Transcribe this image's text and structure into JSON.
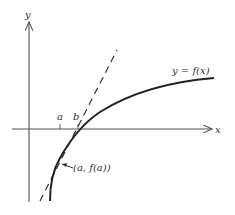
{
  "diagram": {
    "axes": {
      "x_label": "x",
      "y_label": "y"
    },
    "curve_label": "y = f(x)",
    "point_label": "(a, f(a))",
    "ticks": {
      "a_label": "a",
      "b_label": "b"
    },
    "colors": {
      "stroke": "#222222",
      "axis": "#555555",
      "text": "#333333",
      "background": "#ffffff"
    }
  }
}
